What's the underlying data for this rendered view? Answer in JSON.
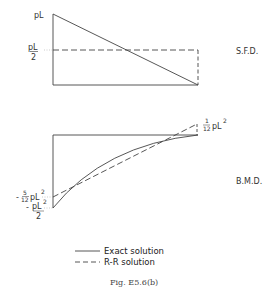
{
  "figure": {
    "caption": "Fig. E5.6(b)",
    "colors": {
      "line": "#444444",
      "background": "#ffffff"
    }
  },
  "sfd": {
    "title": "S.F.D.",
    "label_top": "pL",
    "label_mid_num": "pL",
    "label_mid_den": "2",
    "exact": "linear from pL at left to 0 at right",
    "rr": "constant pL/2"
  },
  "bmd": {
    "title": "B.M.D.",
    "label_right_num": "1",
    "label_right_den": "12",
    "label_right_suffix": "pL",
    "label_right_exp": "2",
    "label_left1_sign": "-",
    "label_left1_num": "5",
    "label_left1_den": "12",
    "label_left1_suffix": "pL",
    "label_left1_exp": "2",
    "label_left2_sign": "-",
    "label_left2_num": "pL",
    "label_left2_exp": "2",
    "label_left2_den": "2",
    "exact": "parabolic from -pL^2/2 at left to 0 at right",
    "rr": "linear from -5/12 pL^2 at left to 1/12 pL^2 at right"
  },
  "legend": {
    "items": [
      {
        "style": "solid",
        "label": "Exact solution"
      },
      {
        "style": "dashed",
        "label": "R-R solution"
      }
    ]
  }
}
